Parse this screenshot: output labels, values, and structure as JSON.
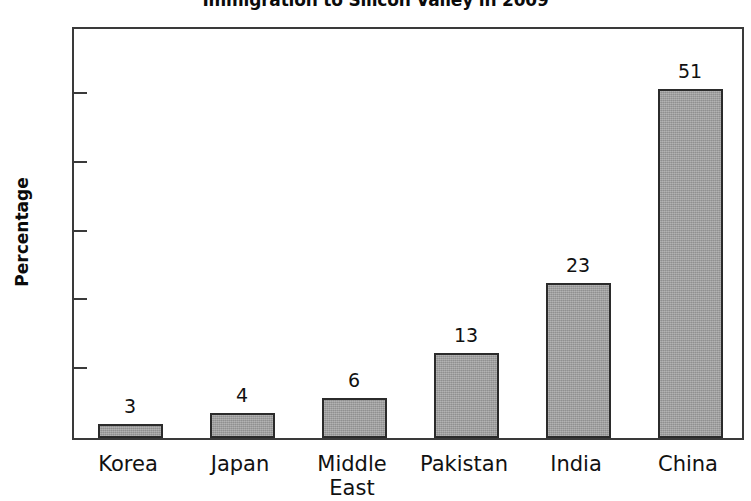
{
  "chart_data": {
    "type": "bar",
    "title": "Immigration to Silicon Valley in 2009",
    "xlabel": "",
    "ylabel": "Percentage",
    "categories": [
      "Korea",
      "Japan",
      "Middle\nEast",
      "Pakistan",
      "India",
      "China"
    ],
    "values": [
      3,
      4,
      6,
      13,
      23,
      51
    ],
    "bar_heights": [
      2.1,
      3.6,
      5.8,
      12.3,
      22.5,
      50.7
    ],
    "data_labels": [
      "3",
      "4",
      "6",
      "13",
      "23",
      "51"
    ],
    "ylim": [
      0,
      60
    ],
    "yticks": [
      0,
      10,
      20,
      30,
      40,
      50,
      60
    ],
    "ytick_labels": [
      "0",
      "10",
      "20",
      "30",
      "40",
      "50",
      "60"
    ],
    "grid": false,
    "legend": false,
    "bar_color": "#9d9d9d",
    "bar_edge_color": "#2b2b2b",
    "axis_color": "#3a3a3a",
    "background_color": "#ffffff",
    "text_color": "#111111"
  }
}
